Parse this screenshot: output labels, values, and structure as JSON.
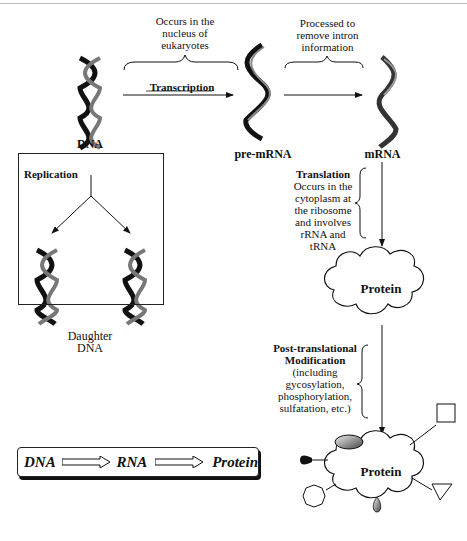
{
  "labels": {
    "nucleus_note": [
      "Occurs in the",
      "nucleus of",
      "eukaryotes"
    ],
    "processing_note": [
      "Processed to",
      "remove intron",
      "information"
    ],
    "transcription": "Transcription",
    "dna": "DNA",
    "pre_mrna": "pre-mRNA",
    "mrna": "mRNA",
    "replication": "Replication",
    "daughter_dna": [
      "Daughter",
      "DNA"
    ],
    "translation_title": "Translation",
    "translation_note": [
      "Occurs in the",
      "cytoplasm at",
      "the ribosome",
      "and involves",
      "rRNA and tRNA"
    ],
    "protein_1": "Protein",
    "ptm_title": [
      "Post-translational",
      "Modification"
    ],
    "ptm_note": [
      "(including",
      "gycosylation,",
      "phosphorylation,",
      "sulfatation, etc.)"
    ],
    "protein_2": "Protein"
  },
  "flow": {
    "step1": "DNA",
    "step2": "RNA",
    "step3": "Protein"
  },
  "icons": {
    "dna_helix": "double-helix",
    "rna_strand": "single-strand-wave",
    "protein_blob": "cloud-shape",
    "modifications": [
      "oval",
      "square",
      "triangle",
      "octagon",
      "teardrop",
      "drop"
    ]
  }
}
